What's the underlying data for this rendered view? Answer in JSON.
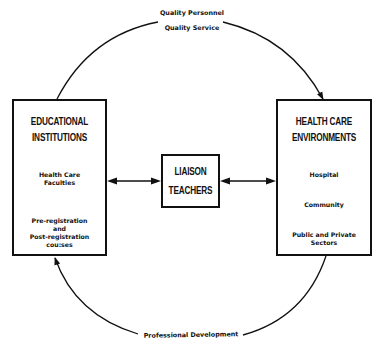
{
  "diagram": {
    "top_arc": {
      "label_line1": "Quality Personnel",
      "label_line2": "Quality Service",
      "direction": "educational-to-health-care"
    },
    "bottom_arc": {
      "label": "Professional Development",
      "direction": "health-care-to-educational"
    },
    "left_box": {
      "title_line1": "EDUCATIONAL",
      "title_line2": "INSTITUTIONS",
      "items": [
        {
          "line1": "Health Care",
          "line2": "Faculties"
        },
        {
          "line1": "Pre-registration",
          "line2": "and",
          "line3": "Post-registration",
          "line4": "cou:ses"
        }
      ]
    },
    "center_box": {
      "title_line1": "LIAISON",
      "title_line2": "TEACHERS"
    },
    "right_box": {
      "title_line1": "HEALTH CARE",
      "title_line2": "ENVIRONMENTS",
      "items": [
        {
          "line1": "Hospital"
        },
        {
          "line1": "Community"
        },
        {
          "line1": "Public and Private",
          "line2": "Sectors"
        }
      ]
    },
    "connectors": [
      {
        "from": "center_box",
        "to": "left_box",
        "type": "double-arrow"
      },
      {
        "from": "center_box",
        "to": "right_box",
        "type": "double-arrow"
      }
    ],
    "colors": {
      "stroke": "#111111",
      "background": "#ffffff"
    }
  }
}
